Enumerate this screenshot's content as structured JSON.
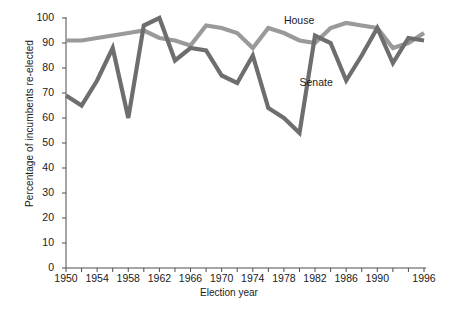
{
  "chart_data": {
    "type": "line",
    "title": "",
    "xlabel": "Election year",
    "ylabel": "Percentage of incumbents re-elected",
    "xlim": [
      1950,
      1996
    ],
    "ylim": [
      0,
      100
    ],
    "grid": false,
    "legend": "inline-annotations",
    "x": [
      1950,
      1952,
      1954,
      1956,
      1958,
      1960,
      1962,
      1964,
      1966,
      1968,
      1970,
      1972,
      1974,
      1976,
      1978,
      1980,
      1982,
      1984,
      1986,
      1988,
      1990,
      1992,
      1994,
      1996
    ],
    "xticks": [
      "1950",
      "1954",
      "1958",
      "1962",
      "1966",
      "1970",
      "1974",
      "1978",
      "1982",
      "1986",
      "1990",
      "1996"
    ],
    "yticks": [
      "0",
      "10",
      "20",
      "30",
      "40",
      "50",
      "60",
      "70",
      "80",
      "90",
      "100"
    ],
    "series": [
      {
        "name": "House",
        "color": "#9a9a9a",
        "values": [
          91,
          91,
          92,
          93,
          94,
          95,
          92,
          91,
          89,
          97,
          96,
          94,
          88,
          96,
          94,
          91,
          90,
          96,
          98,
          97,
          96,
          88,
          90,
          94
        ]
      },
      {
        "name": "Senate",
        "color": "#6e6e6e",
        "values": [
          69,
          65,
          75,
          88,
          60,
          97,
          100,
          83,
          88,
          87,
          77,
          74,
          85,
          64,
          60,
          54,
          93,
          90,
          75,
          85,
          96,
          82,
          92,
          91
        ]
      }
    ],
    "annotations": [
      {
        "text": "House",
        "x": 1978,
        "y": 99
      },
      {
        "text": "Senate",
        "x": 1980,
        "y": 74
      }
    ]
  }
}
